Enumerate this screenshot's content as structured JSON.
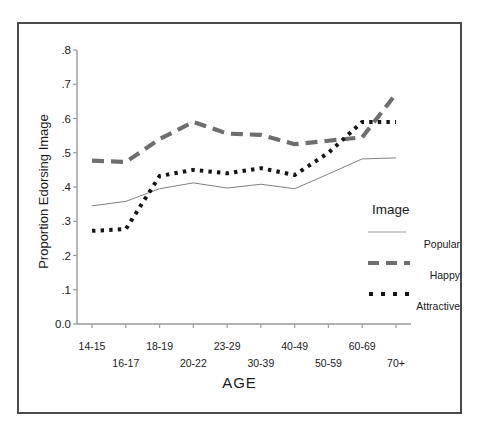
{
  "chart_data": {
    "type": "line",
    "title": "",
    "xlabel": "AGE",
    "ylabel": "Proportion Edorsing Image",
    "categories": [
      "14-15",
      "16-17",
      "18-19",
      "20-22",
      "23-29",
      "30-39",
      "40-49",
      "50-59",
      "60-69",
      "70+"
    ],
    "ylim": [
      0.0,
      0.8
    ],
    "yticks": [
      "0.0",
      ".1",
      ".2",
      ".3",
      ".4",
      ".5",
      ".6",
      ".7",
      ".8"
    ],
    "ytick_values": [
      0.0,
      0.1,
      0.2,
      0.3,
      0.4,
      0.5,
      0.6,
      0.7,
      0.8
    ],
    "grid": false,
    "legend_position": "right",
    "legend_title": "Image",
    "series": [
      {
        "name": "Popular",
        "style": "solid-thin",
        "color": "#808080",
        "values": [
          0.345,
          0.358,
          0.395,
          0.412,
          0.397,
          0.408,
          0.395,
          0.438,
          0.482,
          0.485
        ]
      },
      {
        "name": "Happy",
        "style": "dashed-thick",
        "color": "#6e6e6e",
        "values": [
          0.477,
          0.473,
          0.54,
          0.59,
          0.556,
          0.552,
          0.525,
          0.535,
          0.545,
          0.672
        ]
      },
      {
        "name": "Attractive",
        "style": "dotted-thick",
        "color": "#151515",
        "values": [
          0.272,
          0.277,
          0.432,
          0.45,
          0.44,
          0.455,
          0.435,
          0.5,
          0.59,
          0.59
        ]
      }
    ]
  },
  "legend": {
    "title": "Image",
    "entries": [
      {
        "label": "Popular",
        "swatch": "thin-solid-line-swatch"
      },
      {
        "label": "Happy",
        "swatch": "thick-dashed-line-swatch"
      },
      {
        "label": "Attractive",
        "swatch": "thick-dotted-line-swatch"
      }
    ]
  },
  "axes": {
    "x_title": "AGE",
    "y_title": "Proportion Edorsing Image"
  }
}
